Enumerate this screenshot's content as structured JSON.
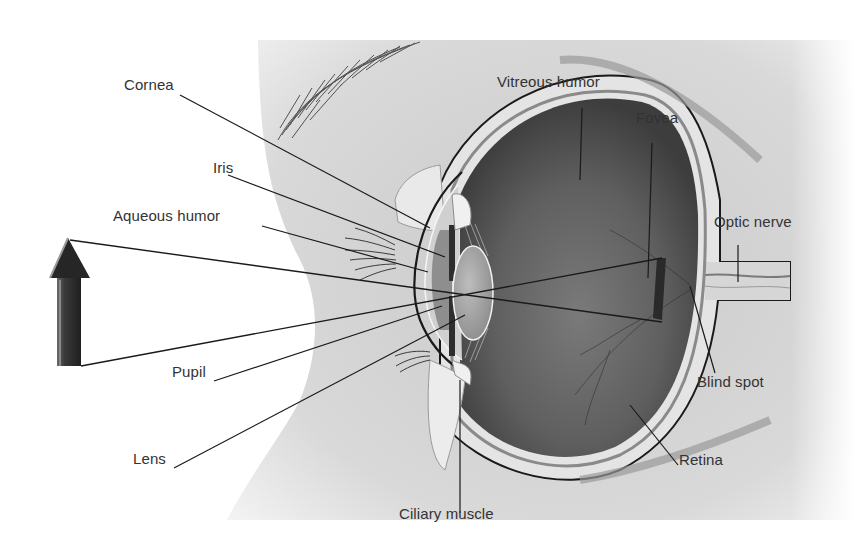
{
  "diagram": {
    "type": "anatomical cross-section",
    "labels": [
      {
        "id": "cornea",
        "text": "Cornea",
        "x": 124,
        "y": 85
      },
      {
        "id": "iris",
        "text": "Iris",
        "x": 213,
        "y": 168
      },
      {
        "id": "aqueous-humor",
        "text": "Aqueous humor",
        "x": 113,
        "y": 216
      },
      {
        "id": "pupil",
        "text": "Pupil",
        "x": 172,
        "y": 372
      },
      {
        "id": "lens",
        "text": "Lens",
        "x": 133,
        "y": 459
      },
      {
        "id": "ciliary-muscle",
        "text": "Ciliary muscle",
        "x": 399,
        "y": 514
      },
      {
        "id": "retina",
        "text": "Retina",
        "x": 679,
        "y": 460
      },
      {
        "id": "blind-spot",
        "text": "Blind spot",
        "x": 697,
        "y": 382
      },
      {
        "id": "optic-nerve",
        "text": "Optic nerve",
        "x": 714,
        "y": 222
      },
      {
        "id": "fovea",
        "text": "Fovea",
        "x": 636,
        "y": 118
      },
      {
        "id": "vitreous-humor",
        "text": "Vitreous humor",
        "x": 497,
        "y": 82
      }
    ],
    "object": {
      "name": "upright-arrow",
      "description": "Object arrow whose inverted image is projected onto the retina"
    },
    "colors": {
      "background": "#ffffff",
      "skin": "#d8d8d8",
      "eye_interior": "#5e5e5e",
      "sclera": "#e6e6e6",
      "lines": "#1a1a1a",
      "text": "#333333"
    }
  }
}
